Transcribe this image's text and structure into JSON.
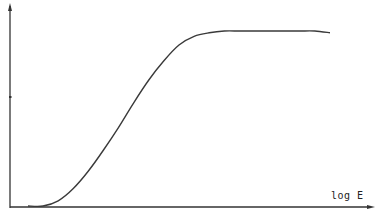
{
  "chart_data": {
    "type": "line",
    "title": "",
    "xlabel": "log E",
    "ylabel": "",
    "grid": false,
    "legend": null,
    "x": [
      0.0,
      0.05,
      0.1,
      0.15,
      0.2,
      0.25,
      0.3,
      0.35,
      0.4,
      0.45,
      0.5,
      0.55,
      0.6,
      0.65,
      0.7,
      0.75,
      0.8,
      0.85,
      0.9,
      0.95,
      1.0
    ],
    "series": [
      {
        "name": "curve",
        "values": [
          0.0,
          0.0,
          0.03,
          0.1,
          0.2,
          0.32,
          0.45,
          0.59,
          0.72,
          0.83,
          0.92,
          0.97,
          0.99,
          1.0,
          1.0,
          1.0,
          1.0,
          1.0,
          1.0,
          1.0,
          0.99
        ]
      }
    ],
    "xlim": [
      0,
      1
    ],
    "ylim": [
      0,
      1.1
    ],
    "axis_units": "relative (no numeric ticks shown)"
  },
  "axes": {
    "x_label": "log E",
    "color": "#333333"
  }
}
